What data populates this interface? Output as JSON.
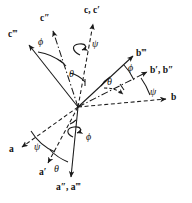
{
  "figure": {
    "origin": {
      "x": 78,
      "y": 107
    },
    "stroke_color": "#1a1a1a",
    "background": "#ffffff"
  },
  "vector_labels": [
    {
      "id": "c-cprime",
      "text": "c, c′",
      "x": 84,
      "y": 6,
      "name": "label-c-cprime"
    },
    {
      "id": "cdoubleprime",
      "text": "c″",
      "x": 40,
      "y": 14,
      "name": "label-c-double-prime"
    },
    {
      "id": "ctripleprime",
      "text": "c‴",
      "x": 8,
      "y": 30,
      "name": "label-c-triple-prime"
    },
    {
      "id": "btripleprime",
      "text": "b‴",
      "x": 136,
      "y": 49,
      "name": "label-b-triple-prime"
    },
    {
      "id": "bprime-bdp",
      "text": "b′, b″",
      "x": 152,
      "y": 67,
      "name": "label-b-prime-b-double-prime"
    },
    {
      "id": "b",
      "text": "b",
      "x": 172,
      "y": 95,
      "name": "label-b"
    },
    {
      "id": "a",
      "text": "a",
      "x": 9,
      "y": 145,
      "name": "label-a"
    },
    {
      "id": "aprime",
      "text": "a′",
      "x": 39,
      "y": 168,
      "name": "label-a-prime"
    },
    {
      "id": "adp-atp",
      "text": "a″, a‴",
      "x": 56,
      "y": 182,
      "name": "label-a-double-prime-a-triple-prime"
    }
  ],
  "angle_labels": [
    {
      "id": "phi-c",
      "text": "ϕ",
      "x": 38,
      "y": 38,
      "name": "angle-phi-c-plane"
    },
    {
      "id": "psi-c",
      "text": "ψ",
      "x": 92,
      "y": 39,
      "name": "angle-psi-c-spin"
    },
    {
      "id": "theta-c",
      "text": "θ",
      "x": 69,
      "y": 69,
      "name": "angle-theta-c-plane"
    },
    {
      "id": "theta-b",
      "text": "θ",
      "x": 108,
      "y": 77,
      "name": "angle-theta-b-plane"
    },
    {
      "id": "phi-b",
      "text": "ϕ",
      "x": 128,
      "y": 65,
      "name": "angle-phi-b-plane"
    },
    {
      "id": "psi-b",
      "text": "ψ",
      "x": 150,
      "y": 88,
      "name": "angle-psi-b-plane"
    },
    {
      "id": "phi-a",
      "text": "ϕ",
      "x": 86,
      "y": 134,
      "name": "angle-phi-a-plane"
    },
    {
      "id": "psi-a",
      "text": "ψ",
      "x": 34,
      "y": 143,
      "name": "angle-psi-a-plane"
    },
    {
      "id": "theta-a",
      "text": "θ",
      "x": 54,
      "y": 165,
      "name": "angle-theta-a-plane"
    }
  ],
  "axes": [
    {
      "id": "c",
      "style": "dashed",
      "name": "axis-c"
    },
    {
      "id": "cpp",
      "style": "dashdot",
      "name": "axis-c-double-prime"
    },
    {
      "id": "cppp",
      "style": "solid",
      "name": "axis-c-triple-prime"
    },
    {
      "id": "b",
      "style": "dashed",
      "name": "axis-b"
    },
    {
      "id": "bpp",
      "style": "dashdot",
      "name": "axis-b-double-prime"
    },
    {
      "id": "bppp",
      "style": "solid",
      "name": "axis-b-triple-prime"
    },
    {
      "id": "a",
      "style": "dashed",
      "name": "axis-a"
    },
    {
      "id": "ap",
      "style": "dashed",
      "name": "axis-a-prime"
    },
    {
      "id": "appp",
      "style": "solid",
      "name": "axis-a-triple-prime"
    }
  ]
}
